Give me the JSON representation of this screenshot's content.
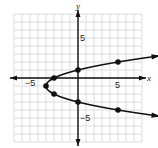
{
  "chart_data": {
    "type": "line",
    "title": "",
    "xlabel": "x",
    "ylabel": "y",
    "xlim": [
      -8,
      8
    ],
    "ylim": [
      -8,
      8
    ],
    "grid": true,
    "tick_labels": {
      "x": [
        {
          "value": -5,
          "label": "−5"
        },
        {
          "value": 5,
          "label": "5"
        }
      ],
      "y": [
        {
          "value": 5,
          "label": "5"
        },
        {
          "value": -5,
          "label": "−5"
        }
      ]
    },
    "curve": {
      "description": "Sideways parabola opening right, x = (y+1)^2 - 4",
      "vertex": [
        -4,
        -1
      ],
      "both_ends_arrows": true
    },
    "points": [
      {
        "x": -4,
        "y": -1
      },
      {
        "x": -3,
        "y": 0
      },
      {
        "x": -3,
        "y": -2
      },
      {
        "x": 0,
        "y": 1
      },
      {
        "x": 0,
        "y": -3
      },
      {
        "x": 5,
        "y": 2
      },
      {
        "x": 5,
        "y": -4
      }
    ],
    "colors": {
      "curve": "#111111",
      "grid": "#d4d4d4",
      "axis": "#111111"
    }
  },
  "labels": {
    "x_axis": "x",
    "y_axis": "y",
    "x_neg5": "−5",
    "x_pos5": "5",
    "y_pos5": "5",
    "y_neg5": "−5"
  }
}
